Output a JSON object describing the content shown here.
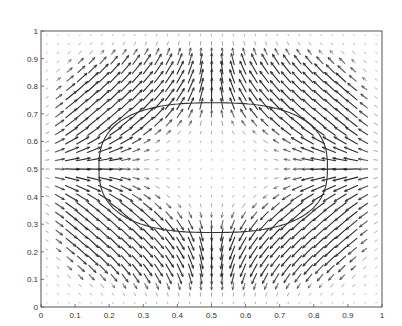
{
  "chart_data": {
    "type": "quiver",
    "title": "",
    "xlabel": "",
    "ylabel": "",
    "xlim": [
      0,
      1
    ],
    "ylim": [
      0,
      1
    ],
    "grid": false,
    "legend": null,
    "x_ticks": [
      0,
      0.1,
      0.2,
      0.3,
      0.4,
      0.5,
      0.6,
      0.7,
      0.8,
      0.9,
      1
    ],
    "x_tick_labels": [
      "0",
      "0.1",
      "0.2",
      "0.3",
      "0.4",
      "0.5",
      "0.6",
      "0.7",
      "0.8",
      "0.9",
      "1"
    ],
    "y_ticks": [
      0,
      0.1,
      0.2,
      0.3,
      0.4,
      0.5,
      0.6,
      0.7,
      0.8,
      0.9,
      1
    ],
    "y_tick_labels": [
      "0",
      "0.1",
      "0.2",
      "0.3",
      "0.4",
      "0.5",
      "0.6",
      "0.7",
      "0.8",
      "0.9",
      "1"
    ],
    "quiver_grid": {
      "nx": 31,
      "ny": 31,
      "x_range": [
        0.016,
        0.984
      ],
      "y_range": [
        0.016,
        0.984
      ]
    },
    "flow_description": "Vector field converging horizontally toward the closed curve (inflow from left and right along y=0.5) and diverging vertically away from it (outflow up and down along x=0.5); near-zero velocity at the interior center; four recirculating vortex-like regions at the corners of the curve",
    "closed_curve": {
      "shape": "flattened ellipse (superellipse)",
      "center": [
        0.505,
        0.505
      ],
      "x_extent": [
        0.17,
        0.84
      ],
      "y_extent": [
        0.27,
        0.74
      ],
      "semi_axis_x": 0.335,
      "semi_axis_y": 0.235,
      "exponent": 2.6
    },
    "colors": {
      "arrows": "#2a2a2a",
      "curve": "#333333",
      "axes": "#555555"
    }
  }
}
